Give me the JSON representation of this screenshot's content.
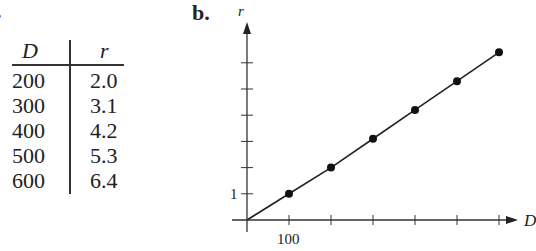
{
  "labels": {
    "part_a": ".",
    "part_b": "b."
  },
  "table": {
    "headers": [
      "D",
      "r"
    ],
    "rows": [
      [
        "200",
        "2.0"
      ],
      [
        "300",
        "3.1"
      ],
      [
        "400",
        "4.2"
      ],
      [
        "500",
        "5.3"
      ],
      [
        "600",
        "6.4"
      ]
    ]
  },
  "chart_data": {
    "type": "line",
    "title": "",
    "xlabel": "D",
    "ylabel": "r",
    "x": [
      100,
      200,
      300,
      400,
      500,
      600
    ],
    "values": [
      1.0,
      2.0,
      3.1,
      4.2,
      5.3,
      6.4
    ],
    "series": [
      {
        "name": "r vs D",
        "x": [
          100,
          200,
          300,
          400,
          500,
          600
        ],
        "values": [
          1.0,
          2.0,
          3.1,
          4.2,
          5.3,
          6.4
        ]
      }
    ],
    "x_ticks": [
      100,
      200,
      300,
      400,
      500,
      600
    ],
    "y_ticks": [
      1,
      2,
      3,
      4,
      5,
      6
    ],
    "x_tick_labels_shown": [
      "100"
    ],
    "y_tick_labels_shown": [
      "1"
    ],
    "line_through_origin": true,
    "markers": "filled circles",
    "grid": false,
    "legend": false
  },
  "axis_text": {
    "x_label": "D",
    "y_label": "r",
    "x_tick": "100",
    "y_tick": "1"
  }
}
